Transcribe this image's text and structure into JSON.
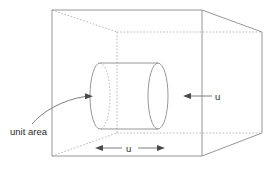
{
  "figure": {
    "background_color": "#ffffff",
    "line_color": "#8a8a8a",
    "hidden_line_color": "#a8a8a8",
    "text_color": "#2b2b2b"
  },
  "labels": {
    "unit_area": "unit area",
    "speed_right": "u",
    "length_bottom": "u"
  },
  "geometry": {
    "front_face": {
      "x1": 52,
      "y1": 10,
      "x2": 202,
      "y2": 156
    },
    "back_face": {
      "x1": 117,
      "y1": 32,
      "x2": 262,
      "y2": 133
    },
    "cylinder": {
      "left_center_x": 100,
      "right_center_x": 158,
      "center_y": 96,
      "rx": 10,
      "ry": 33
    }
  }
}
